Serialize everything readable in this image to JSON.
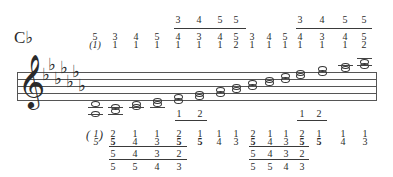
{
  "title": "C♭",
  "key_signature": {
    "clef": "treble",
    "flats": 7
  },
  "right_hand": {
    "columns": [
      {
        "x": 95,
        "upper": "5",
        "lower": "(1)"
      },
      {
        "x": 115,
        "upper": "3",
        "lower": "1"
      },
      {
        "x": 136,
        "upper": "4",
        "lower": "1"
      },
      {
        "x": 157,
        "upper": "5",
        "lower": "1"
      },
      {
        "x": 178,
        "upper": "4",
        "lower": "1",
        "top": "3"
      },
      {
        "x": 199,
        "upper": "3",
        "lower": "1",
        "top": "4"
      },
      {
        "x": 220,
        "upper": "4",
        "lower": "1",
        "top": "5"
      },
      {
        "x": 236,
        "upper": "5",
        "lower": "2",
        "top": "5"
      },
      {
        "x": 252,
        "upper": "3",
        "lower": "1"
      },
      {
        "x": 269,
        "upper": "4",
        "lower": "1"
      },
      {
        "x": 285,
        "upper": "5",
        "lower": "1"
      },
      {
        "x": 300,
        "upper": "4",
        "lower": "1",
        "top": "3"
      },
      {
        "x": 322,
        "upper": "3",
        "lower": "1",
        "top": "4"
      },
      {
        "x": 345,
        "upper": "4",
        "lower": "1",
        "top": "5"
      },
      {
        "x": 364,
        "upper": "5",
        "lower": "2",
        "top": "5"
      }
    ]
  },
  "left_hand": {
    "paren_label_top": "1",
    "paren_label_bottom": "5",
    "columns": [
      {
        "x": 113,
        "upper": "2",
        "lower": "5",
        "row3": "5",
        "row4": "5"
      },
      {
        "x": 135,
        "upper": "1",
        "lower": "4",
        "row3": "4",
        "row4": "5"
      },
      {
        "x": 157,
        "upper": "1",
        "lower": "3",
        "row3": "3",
        "row4": "4"
      },
      {
        "x": 179,
        "upper": "2",
        "lower": "5",
        "row3": "2",
        "row4": "3",
        "top": "1"
      },
      {
        "x": 200,
        "upper": "1",
        "lower": "5",
        "top": "2"
      },
      {
        "x": 219,
        "upper": "1",
        "lower": "4"
      },
      {
        "x": 236,
        "upper": "1",
        "lower": "3"
      },
      {
        "x": 253,
        "upper": "2",
        "lower": "5",
        "row3": "5",
        "row4": "5"
      },
      {
        "x": 270,
        "upper": "1",
        "lower": "4",
        "row3": "4",
        "row4": "5"
      },
      {
        "x": 286,
        "upper": "1",
        "lower": "3",
        "row3": "3",
        "row4": "4"
      },
      {
        "x": 302,
        "upper": "2",
        "lower": "5",
        "row3": "2",
        "row4": "3",
        "top": "1"
      },
      {
        "x": 319,
        "upper": "1",
        "lower": "5",
        "top": "2"
      },
      {
        "x": 343,
        "upper": "1",
        "lower": "4"
      },
      {
        "x": 365,
        "upper": "1",
        "lower": "3"
      }
    ]
  }
}
